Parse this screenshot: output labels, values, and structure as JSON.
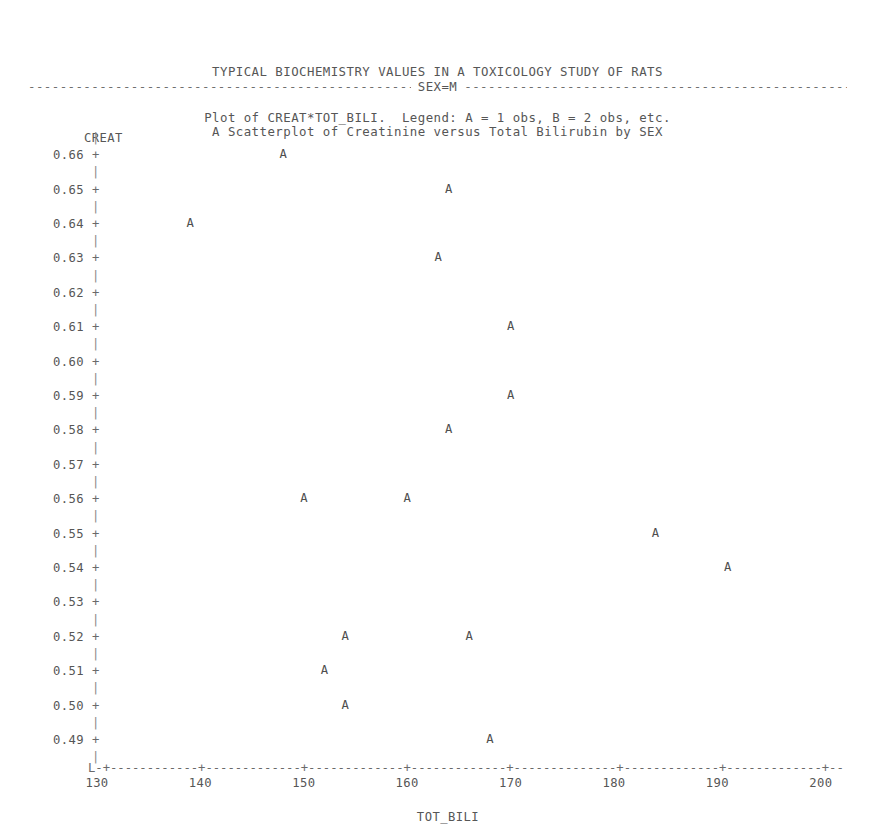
{
  "report": {
    "title_line1": "TYPICAL BIOCHEMISTRY VALUES IN A TOXICOLOGY STUDY OF RATS",
    "title_line2": "A Scatterplot of Creatinine versus Total Bilirubin by SEX",
    "by_group_label": "SEX=M",
    "by_group_dashes": "---------------------------------------------------------------------------------------------------------------------------------------------------------------",
    "plot_caption": "Plot of CREAT*TOT_BILI.  Legend: A = 1 obs, B = 2 obs, etc."
  },
  "chart_data": {
    "type": "scatter",
    "title": "TYPICAL BIOCHEMISTRY VALUES IN A TOXICOLOGY STUDY OF RATS",
    "subtitle": "A Scatterplot of Creatinine versus Total Bilirubin by SEX",
    "caption": "Plot of CREAT*TOT_BILI.  Legend: A = 1 obs, B = 2 obs, etc.",
    "xlabel": "TOT_BILI",
    "ylabel": "CREAT",
    "grid": false,
    "legend": "A = 1 obs, B = 2 obs, etc.",
    "legend_position": "caption",
    "plot_symbol": "A",
    "xlim": [
      130,
      200
    ],
    "ylim": [
      0.49,
      0.66
    ],
    "xticks": [
      130,
      140,
      150,
      160,
      170,
      180,
      190,
      200
    ],
    "xtick_labels": [
      "130",
      "140",
      "150",
      "160",
      "170",
      "180",
      "190",
      "200"
    ],
    "yticks": [
      0.66,
      0.65,
      0.64,
      0.63,
      0.62,
      0.61,
      0.6,
      0.59,
      0.58,
      0.57,
      0.56,
      0.55,
      0.54,
      0.53,
      0.52,
      0.51,
      0.5,
      0.49
    ],
    "ytick_labels": [
      "0.66",
      "0.65",
      "0.64",
      "0.63",
      "0.62",
      "0.61",
      "0.60",
      "0.59",
      "0.58",
      "0.57",
      "0.56",
      "0.55",
      "0.54",
      "0.53",
      "0.52",
      "0.51",
      "0.50",
      "0.49"
    ],
    "origin_symbol": "L",
    "points": [
      {
        "label": "A",
        "x": 148,
        "y": 0.66
      },
      {
        "label": "A",
        "x": 164,
        "y": 0.65
      },
      {
        "label": "A",
        "x": 139,
        "y": 0.64
      },
      {
        "label": "A",
        "x": 163,
        "y": 0.63
      },
      {
        "label": "A",
        "x": 170,
        "y": 0.61
      },
      {
        "label": "A",
        "x": 170,
        "y": 0.59
      },
      {
        "label": "A",
        "x": 164,
        "y": 0.58
      },
      {
        "label": "A",
        "x": 150,
        "y": 0.56
      },
      {
        "label": "A",
        "x": 160,
        "y": 0.56
      },
      {
        "label": "A",
        "x": 184,
        "y": 0.55
      },
      {
        "label": "A",
        "x": 191,
        "y": 0.54
      },
      {
        "label": "A",
        "x": 154,
        "y": 0.52
      },
      {
        "label": "A",
        "x": 166,
        "y": 0.52
      },
      {
        "label": "A",
        "x": 152,
        "y": 0.51
      },
      {
        "label": "A",
        "x": 154,
        "y": 0.5
      },
      {
        "label": "A",
        "x": 168,
        "y": 0.49
      }
    ]
  },
  "axis_art": {
    "x_axis_line": "L-+------------+------------+------------+------------+------------+------------+------------+--",
    "y_axis_bar": "|",
    "y_tick_mark": "+"
  }
}
